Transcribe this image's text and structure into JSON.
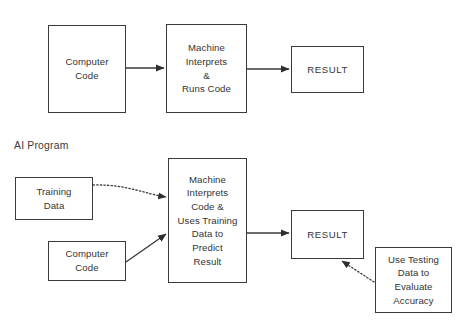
{
  "diagram": {
    "title_visible": false,
    "background_color": "#ffffff",
    "line_color": "#3a3a3a",
    "text_color": "#333333",
    "sections": [
      {
        "id": "traditional-program",
        "label": "",
        "label_visible": false
      },
      {
        "id": "ai-program",
        "label": "AI Program",
        "label_visible": true
      }
    ],
    "nodes": [
      {
        "id": "top-computer-code",
        "name": "computer-code-box-top",
        "text": "Computer\nCode",
        "x": 48,
        "y": 25,
        "w": 78,
        "h": 88
      },
      {
        "id": "top-machine",
        "name": "machine-interprets-runs-code-box",
        "text": "Machine\nInterprets\n&\nRuns Code",
        "x": 166,
        "y": 24,
        "w": 81,
        "h": 89
      },
      {
        "id": "top-result",
        "name": "result-box-top",
        "text": "RESULT",
        "x": 291,
        "y": 46,
        "w": 73,
        "h": 47
      },
      {
        "id": "training-data",
        "name": "training-data-box",
        "text": "Training\nData",
        "x": 15,
        "y": 177,
        "w": 78,
        "h": 43
      },
      {
        "id": "bottom-computer-code",
        "name": "computer-code-box-bottom",
        "text": "Computer\nCode",
        "x": 48,
        "y": 241,
        "w": 78,
        "h": 40
      },
      {
        "id": "bottom-machine",
        "name": "machine-predict-result-box",
        "text": "Machine\nInterprets\nCode &\nUses Training\nData to\nPredict\nResult",
        "x": 168,
        "y": 158,
        "w": 79,
        "h": 125
      },
      {
        "id": "bottom-result",
        "name": "result-box-bottom",
        "text": "RESULT",
        "x": 291,
        "y": 210,
        "w": 73,
        "h": 49
      },
      {
        "id": "testing-data",
        "name": "use-testing-data-box",
        "text": "Use Testing\nData to\nEvaluate\nAccuracy",
        "x": 375,
        "y": 247,
        "w": 77,
        "h": 66
      }
    ],
    "edges": [
      {
        "id": "edge-1",
        "name": "arrow-computer-code-to-machine",
        "style": "solid",
        "from": "top-computer-code",
        "to": "top-machine",
        "x1": 126,
        "y1": 68,
        "x2": 164,
        "y2": 68
      },
      {
        "id": "edge-2",
        "name": "arrow-machine-to-result",
        "style": "solid",
        "from": "top-machine",
        "to": "top-result",
        "x1": 247,
        "y1": 69,
        "x2": 289,
        "y2": 69
      },
      {
        "id": "edge-3",
        "name": "dotted-arrow-training-data-to-machine",
        "style": "dotted",
        "from": "training-data",
        "to": "bottom-machine",
        "x1": 93,
        "y1": 185,
        "x2": 166,
        "y2": 197
      },
      {
        "id": "edge-4",
        "name": "arrow-computer-code-to-machine-bottom",
        "style": "solid",
        "from": "bottom-computer-code",
        "to": "bottom-machine",
        "x1": 126,
        "y1": 262,
        "x2": 166,
        "y2": 234
      },
      {
        "id": "edge-5",
        "name": "arrow-machine-to-result-bottom",
        "style": "solid",
        "from": "bottom-machine",
        "to": "bottom-result",
        "x1": 247,
        "y1": 233,
        "x2": 289,
        "y2": 233
      },
      {
        "id": "edge-6",
        "name": "dotted-arrow-testing-data-to-result",
        "style": "dotted",
        "from": "testing-data",
        "to": "bottom-result",
        "x1": 374,
        "y1": 282,
        "x2": 342,
        "y2": 261
      }
    ]
  }
}
